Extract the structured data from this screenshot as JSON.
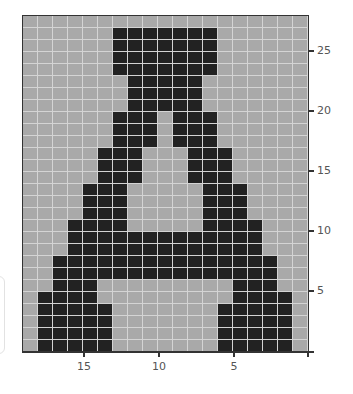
{
  "chart_data": {
    "type": "heatmap",
    "title": "",
    "xlabel": "",
    "ylabel": "",
    "grid": {
      "columns": 19,
      "rows": 28,
      "on_color": "#222222",
      "off_color": "#a9a9a9",
      "line_color": "#d4d4d4"
    },
    "x_axis": {
      "direction": "right-to-left",
      "range": [
        0,
        19
      ],
      "ticks": [
        15,
        10,
        5,
        0
      ],
      "tick_labels": [
        "15",
        "10",
        "5",
        ""
      ]
    },
    "y_axis": {
      "position": "right",
      "range": [
        0,
        28
      ],
      "ticks": [
        25,
        20,
        15,
        10,
        5,
        0
      ],
      "tick_labels": [
        "25",
        "20",
        "15",
        "10",
        "5",
        ""
      ]
    },
    "rows_top_to_bottom": [
      "0000000000000000000",
      "0000001111111000000",
      "0000001111111000000",
      "0000001111111000000",
      "0000001111111000000",
      "0000000111110000000",
      "0000000111110000000",
      "0000000111110000000",
      "0000001110111000000",
      "0000001110111000000",
      "0000001110111000000",
      "0000011100011100000",
      "0000011100011100000",
      "0000011100011100000",
      "0000111000001110000",
      "0000111000001110000",
      "0000111000001110000",
      "0001111000001111000",
      "0001111111111111000",
      "0001111111111111000",
      "0011111111111111100",
      "0011111111111111100",
      "0011100000000011100",
      "0111100000000011110",
      "0111110000000111110",
      "0111110000000111110",
      "0111110000000111110",
      "0111110000000111110"
    ],
    "legend": null,
    "grid_lines": true
  },
  "axes": {
    "x_ticks": [
      {
        "label": "15",
        "x": 84
      },
      {
        "label": "10",
        "x": 159
      },
      {
        "label": "5",
        "x": 234
      }
    ],
    "y_ticks": [
      {
        "label": "25",
        "y": 51
      },
      {
        "label": "20",
        "y": 111
      },
      {
        "label": "15",
        "y": 171
      },
      {
        "label": "10",
        "y": 231
      },
      {
        "label": "5",
        "y": 291
      }
    ]
  }
}
